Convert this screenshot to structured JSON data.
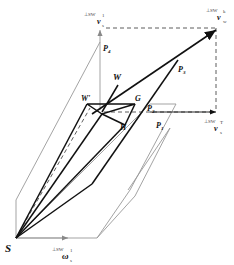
{
  "diagram": {
    "labels": {
      "S": "S",
      "W": "W",
      "W_prime": "W'",
      "G": "G",
      "H": "H",
      "P1": "P",
      "P1_sub": "1",
      "P2": "P",
      "P2_sub": "2",
      "P3": "P",
      "P3_sub": "3",
      "P4": "P",
      "P4_sub": "4",
      "v_top": "v",
      "v_top_sup": "⊥SW",
      "v_top_idx": "1",
      "v_top_sub": "s",
      "v_right": "v",
      "v_right_sup": "⊥SW",
      "v_right_idx": "k",
      "v_right_sub": "w",
      "v_mid": "v",
      "v_mid_sup": "⊥SW",
      "v_mid_idx": "T",
      "v_mid_sub": "s",
      "omega": "ω",
      "omega_sup": "⊥SW",
      "omega_idx": "1",
      "omega_sub": "s"
    }
  }
}
